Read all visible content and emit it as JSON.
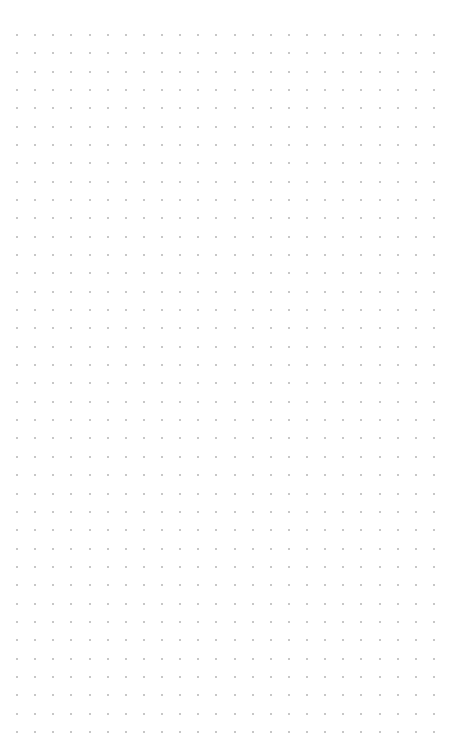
{
  "canvas": {
    "background": "#ffffff",
    "grid": {
      "type": "dot-grid",
      "columns": 24,
      "rows": 39,
      "origin_x": 17,
      "origin_y": 35,
      "spacing_x": 18.13,
      "spacing_y": 18.34,
      "dot_size": 2,
      "dot_color": "#b4b4b4"
    }
  }
}
